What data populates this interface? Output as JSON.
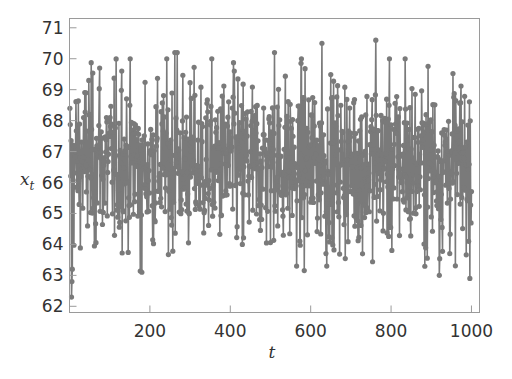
{
  "chart_data": {
    "type": "line",
    "title": "",
    "xlabel": "t",
    "ylabel": "x_t",
    "ylabel_main": "x",
    "ylabel_sub": "t",
    "xlim": [
      0,
      1020
    ],
    "ylim": [
      61.8,
      71.3
    ],
    "xticks": [
      200,
      400,
      600,
      800,
      1000
    ],
    "xtick_labels": [
      "200",
      "400",
      "600",
      "800",
      "1000"
    ],
    "yticks": [
      62,
      63,
      64,
      65,
      66,
      67,
      68,
      69,
      70,
      71
    ],
    "ytick_labels": [
      "62",
      "63",
      "64",
      "65",
      "66",
      "67",
      "68",
      "69",
      "70",
      "71"
    ],
    "grid": false,
    "legend": null,
    "marker": "circle",
    "line_color": "#7a7a7a",
    "marker_color": "#7a7a7a",
    "n_points": 1000,
    "series": [
      {
        "name": "x_t",
        "description": "Noisy stationary time series, t = 1..1000, mean approx 66.6, fluctuating between ~62.3 and ~70.6",
        "notable_points": [
          {
            "t": 5,
            "x": 62.3
          },
          {
            "t": 6,
            "x": 62.8
          },
          {
            "t": 7,
            "x": 63.2
          },
          {
            "t": 48,
            "x": 69.3
          },
          {
            "t": 75,
            "x": 69.7
          },
          {
            "t": 130,
            "x": 69.6
          },
          {
            "t": 180,
            "x": 63.1
          },
          {
            "t": 262,
            "x": 70.2
          },
          {
            "t": 268,
            "x": 70.2
          },
          {
            "t": 410,
            "x": 69.6
          },
          {
            "t": 430,
            "x": 64.0
          },
          {
            "t": 510,
            "x": 70.2
          },
          {
            "t": 565,
            "x": 63.3
          },
          {
            "t": 628,
            "x": 70.5
          },
          {
            "t": 640,
            "x": 63.3
          },
          {
            "t": 762,
            "x": 70.6
          },
          {
            "t": 835,
            "x": 70.0
          },
          {
            "t": 920,
            "x": 63.0
          },
          {
            "t": 993,
            "x": 64.1
          }
        ]
      }
    ],
    "generator": {
      "seed": 12345,
      "mean": 66.6,
      "sd": 1.35,
      "min": 62.3,
      "max": 70.6
    }
  }
}
